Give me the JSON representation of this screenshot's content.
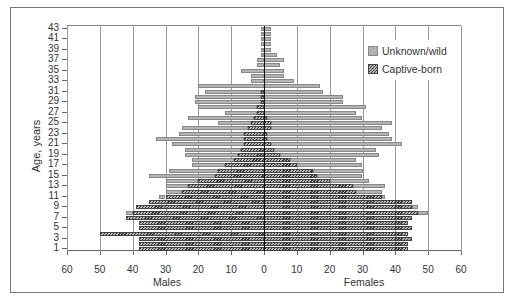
{
  "chart_data": {
    "type": "bar",
    "subtype": "population-pyramid",
    "title": "",
    "ylabel": "Age, years",
    "xlabel_left": "Males",
    "xlabel_right": "Females",
    "x_ticks": [
      60,
      50,
      40,
      30,
      20,
      10,
      0,
      10,
      20,
      30,
      40,
      50,
      60
    ],
    "xlim": [
      -60,
      60
    ],
    "y_ticks": [
      1,
      3,
      5,
      7,
      9,
      11,
      13,
      15,
      17,
      19,
      21,
      23,
      25,
      27,
      29,
      31,
      33,
      35,
      37,
      39,
      41,
      43
    ],
    "grid": "vertical every 10",
    "legend": {
      "position": "upper right",
      "entries": [
        "Unknown/wild",
        "Captive-born"
      ]
    },
    "ages": [
      1,
      2,
      3,
      4,
      5,
      6,
      7,
      8,
      9,
      10,
      11,
      12,
      13,
      14,
      15,
      16,
      17,
      18,
      19,
      20,
      21,
      22,
      23,
      24,
      25,
      26,
      27,
      28,
      29,
      30,
      31,
      32,
      33,
      34,
      35,
      36,
      37,
      38,
      39,
      40,
      41,
      42,
      43
    ],
    "series": [
      {
        "name": "Males Captive-born",
        "values": [
          38,
          38,
          38,
          50,
          38,
          38,
          42,
          40,
          39,
          35,
          30,
          25,
          23,
          20,
          15,
          14,
          12,
          9,
          8,
          7,
          6,
          6,
          6,
          5,
          4,
          3,
          2,
          2,
          1,
          1,
          1,
          0,
          0,
          0,
          0,
          0,
          0,
          0,
          0,
          0,
          0,
          0,
          0
        ]
      },
      {
        "name": "Males Unknown/wild",
        "values": [
          0,
          0,
          0,
          0,
          0,
          0,
          0,
          2,
          0,
          0,
          2,
          5,
          7,
          10,
          20,
          15,
          10,
          13,
          16,
          17,
          22,
          27,
          20,
          20,
          10,
          20,
          10,
          18,
          20,
          20,
          17,
          20,
          4,
          4,
          7,
          2,
          2,
          1,
          1,
          1,
          1,
          1,
          1
        ]
      },
      {
        "name": "Females Captive-born",
        "values": [
          44,
          44,
          45,
          44,
          45,
          44,
          45,
          47,
          45,
          45,
          36,
          28,
          27,
          20,
          16,
          15,
          10,
          8,
          5,
          3,
          2,
          1,
          1,
          2,
          2,
          1,
          0,
          0,
          0,
          0,
          0,
          0,
          0,
          0,
          0,
          0,
          0,
          0,
          0,
          0,
          0,
          0,
          0
        ]
      },
      {
        "name": "Females Unknown/wild",
        "values": [
          0,
          0,
          0,
          0,
          0,
          0,
          0,
          3,
          2,
          0,
          1,
          8,
          10,
          12,
          14,
          15,
          20,
          20,
          30,
          31,
          40,
          38,
          37,
          34,
          37,
          29,
          28,
          31,
          24,
          24,
          18,
          17,
          9,
          6,
          6,
          5,
          6,
          4,
          2,
          2,
          2,
          2,
          2
        ]
      }
    ]
  }
}
